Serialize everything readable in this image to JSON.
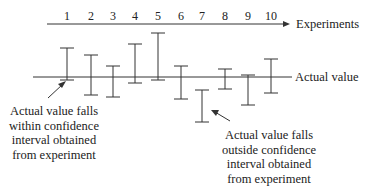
{
  "diagram": {
    "title": "",
    "axis_label": "Experiments",
    "reference_label": "Actual value",
    "experiments": [
      {
        "label": "1",
        "x": 67,
        "top": 48,
        "bottom": 80
      },
      {
        "label": "2",
        "x": 91,
        "top": 55,
        "bottom": 95
      },
      {
        "label": "3",
        "x": 113,
        "top": 66,
        "bottom": 97
      },
      {
        "label": "4",
        "x": 135,
        "top": 44,
        "bottom": 83
      },
      {
        "label": "5",
        "x": 158,
        "top": 33,
        "bottom": 80
      },
      {
        "label": "6",
        "x": 181,
        "top": 66,
        "bottom": 99
      },
      {
        "label": "7",
        "x": 202,
        "top": 90,
        "bottom": 122
      },
      {
        "label": "8",
        "x": 225,
        "top": 69,
        "bottom": 89
      },
      {
        "label": "9",
        "x": 248,
        "top": 75,
        "bottom": 105
      },
      {
        "label": "10",
        "x": 271,
        "top": 59,
        "bottom": 93
      }
    ],
    "annotations": {
      "within": [
        "Actual value falls",
        "within confidence",
        "interval obtained",
        "from experiment"
      ],
      "outside": [
        "Actual value falls",
        "outside confidence",
        "interval obtained",
        "from experiment"
      ]
    },
    "colors": {
      "line": "#333333",
      "text": "#222222"
    }
  }
}
